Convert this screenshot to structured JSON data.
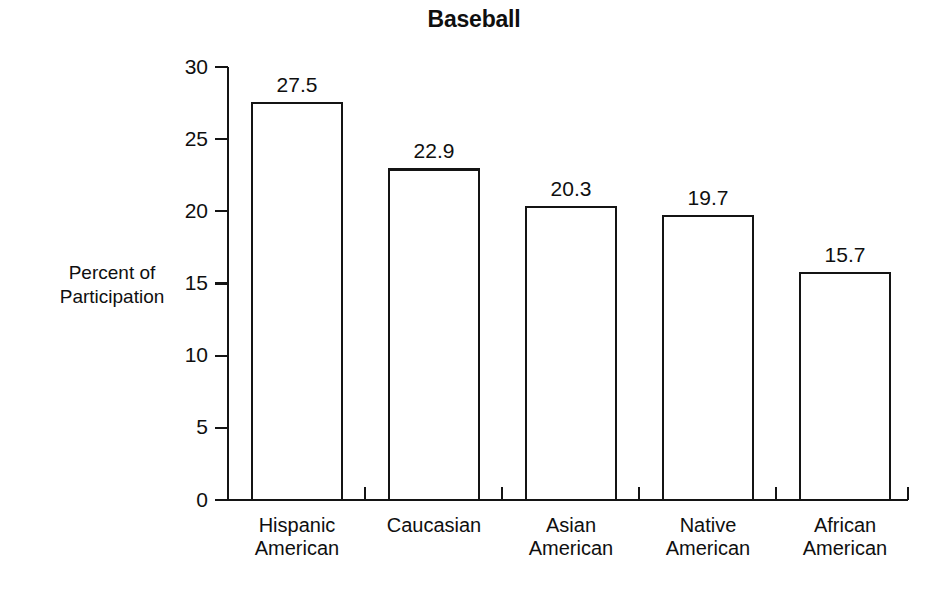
{
  "chart_data": {
    "type": "bar",
    "title": "Baseball",
    "categories": [
      "Hispanic American",
      "Caucasian",
      "Asian American",
      "Native American",
      "African American"
    ],
    "category_lines": [
      [
        "Hispanic",
        "American"
      ],
      [
        "Caucasian",
        ""
      ],
      [
        "Asian",
        "American"
      ],
      [
        "Native",
        "American"
      ],
      [
        "African",
        "American"
      ]
    ],
    "values": [
      27.5,
      22.9,
      20.3,
      19.7,
      15.7
    ],
    "value_labels": [
      "27.5",
      "22.9",
      "20.3",
      "19.7",
      "15.7"
    ],
    "xlabel": "",
    "ylabel": "Percent of Participation",
    "ylabel_lines": [
      "Percent of",
      "Participation"
    ],
    "ylim": [
      0,
      30
    ],
    "ytick_values": [
      0,
      5,
      10,
      15,
      20,
      25,
      30
    ],
    "ytick_labels": [
      "0",
      "5",
      "10",
      "15",
      "20",
      "25",
      "30"
    ],
    "grid": false,
    "legend": false,
    "legend_position": "none",
    "bar_fill_color": "#ffffff",
    "bar_border_color": "#141414",
    "text_color": "#0f0f0f",
    "background_color": "#ffffff"
  }
}
